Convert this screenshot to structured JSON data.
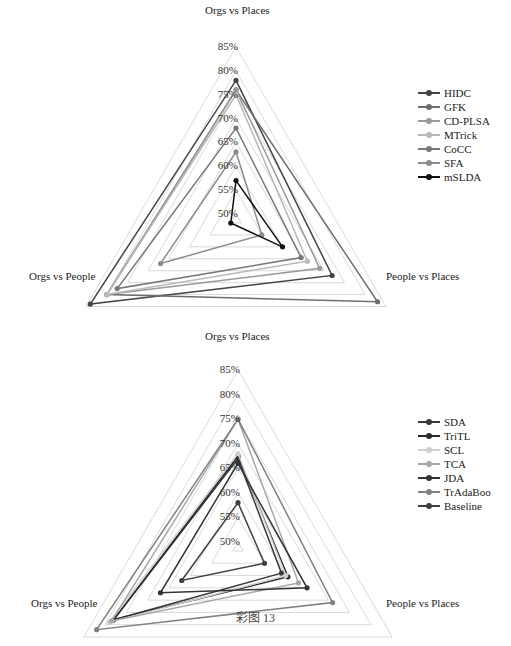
{
  "figure": {
    "caption": "彩图 13"
  },
  "chart_data": [
    {
      "type": "radar",
      "title": "",
      "axes": [
        "Orgs vs Places",
        "People vs Places",
        "Orgs vs People"
      ],
      "tick_labels": [
        "85%",
        "80%",
        "75%",
        "70%",
        "65%",
        "60%",
        "55%",
        "50%"
      ],
      "range": [
        50,
        85
      ],
      "grid": true,
      "legend_position": "right",
      "series": [
        {
          "name": "HIDC",
          "color": "#444444",
          "values": [
            78,
            72,
            84
          ]
        },
        {
          "name": "GFK",
          "color": "#6e6e6e",
          "values": [
            76,
            83,
            80
          ]
        },
        {
          "name": "CD-PLSA",
          "color": "#9a9a9a",
          "values": [
            76,
            69,
            80
          ]
        },
        {
          "name": "MTrick",
          "color": "#b8b8b8",
          "values": [
            75,
            66,
            80
          ]
        },
        {
          "name": "CoCC",
          "color": "#787878",
          "values": [
            68,
            64.5,
            77.5
          ]
        },
        {
          "name": "SFA",
          "color": "#8c8c8c",
          "values": [
            63,
            55,
            67
          ]
        },
        {
          "name": "mSLDA",
          "color": "#111111",
          "values": [
            57,
            60,
            50
          ]
        }
      ]
    },
    {
      "type": "radar",
      "title": "",
      "axes": [
        "Orgs vs Places",
        "People vs Places",
        "Orgs vs People"
      ],
      "tick_labels": [
        "85%",
        "80%",
        "75%",
        "70%",
        "65%",
        "60%",
        "55%",
        "50%"
      ],
      "range": [
        50,
        85
      ],
      "grid": true,
      "legend_position": "right",
      "series": [
        {
          "name": "SDA",
          "color": "#3a3a3a",
          "values": [
            67,
            59,
            78
          ]
        },
        {
          "name": "TriTL",
          "color": "#2a2a2a",
          "values": [
            67.5,
            60.5,
            78
          ]
        },
        {
          "name": "SCL",
          "color": "#d0d0d0",
          "values": [
            68,
            60,
            79
          ]
        },
        {
          "name": "TCA",
          "color": "#a8a8a8",
          "values": [
            75,
            63,
            78.5
          ]
        },
        {
          "name": "JDA",
          "color": "#333333",
          "values": [
            66,
            65,
            67
          ]
        },
        {
          "name": "TrAdaBoo",
          "color": "#808080",
          "values": [
            75,
            71,
            82
          ]
        },
        {
          "name": "Baseline",
          "color": "#404040",
          "values": [
            58,
            55,
            62
          ]
        }
      ]
    }
  ]
}
